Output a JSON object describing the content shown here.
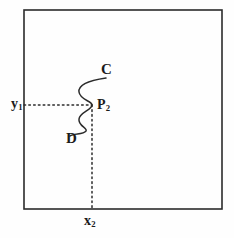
{
  "figure": {
    "kind": "geometry-diagram",
    "background_color": "#fefefe",
    "stroke_color": "#2b2b2b",
    "label_color": "#1b1b1b"
  },
  "frame": {
    "name": "bounding-rectangle",
    "x": 24,
    "y": 10,
    "width": 198,
    "height": 199,
    "stroke_width": 1.6
  },
  "curve": {
    "name": "serpentine-curve-CD",
    "path": "M 106 78 C 92 80, 78 84, 79 92 C 80 100, 92 101, 92 105 C 92 110, 80 112, 79 119 C 78 126, 88 128, 86 131 C 83 135, 74 133, 70 136",
    "stroke_width": 1.5,
    "upper_endpoint_label": "C",
    "lower_endpoint_label": "D"
  },
  "horizontal_dotted_line": {
    "name": "y1-guide-line",
    "x1": 24,
    "y1": 105,
    "x2": 92,
    "y2": 105,
    "dash": "1.6 3.2"
  },
  "vertical_dotted_line": {
    "name": "x2-guide-line",
    "x1": 92,
    "y1": 105,
    "x2": 92,
    "y2": 209,
    "dash": "1.6 3.2"
  },
  "labels": {
    "curve_upper": "C",
    "curve_lower": "D",
    "point": "P",
    "point_sub": "2",
    "y_axis": "y",
    "y_axis_sub": "1",
    "x_axis": "x",
    "x_axis_sub": "2"
  }
}
